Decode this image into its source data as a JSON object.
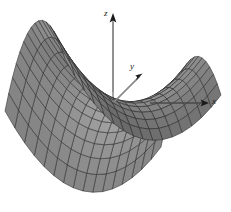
{
  "figure": {
    "title": "",
    "background_color": "#ffffff",
    "width": 231,
    "height": 212
  },
  "axes": {
    "x": {
      "label": "x",
      "color": "#555555",
      "arrow": "right",
      "label_pos": [
        212,
        97
      ]
    },
    "y": {
      "label": "y",
      "color": "#555555",
      "arrow": "up-right",
      "label_pos": [
        130,
        62
      ]
    },
    "z": {
      "label": "z",
      "color": "#555555",
      "arrow": "up",
      "label_pos": [
        104,
        9
      ]
    }
  },
  "chart_data": {
    "type": "surface",
    "title": "",
    "xlabel": "x",
    "ylabel": "y",
    "zlabel": "z",
    "surface_name": "hyperbolic-paraboloid-saddle",
    "equation": "z = x^2 - y^2",
    "xlim": [
      -1,
      1
    ],
    "ylim": [
      -1,
      1
    ],
    "zlim": [
      -1,
      1
    ],
    "grid_u_count": 16,
    "grid_v_count": 16,
    "mesh_color": "#2b2b2b",
    "fill_light": "#e8e8e8",
    "fill_dark": "#4a4a4a",
    "shading": "grayscale-lambert",
    "view": {
      "azimuth_deg": -58,
      "elevation_deg": 22,
      "origin_px": [
        113,
        103
      ]
    },
    "grid": false,
    "legend": null,
    "annotations": []
  }
}
